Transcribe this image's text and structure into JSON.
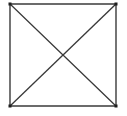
{
  "figure": {
    "background_color": "#ffffff",
    "stroke_color": "#3a3a3a",
    "corner_accent_color": "#1e1e1e",
    "stroke_width": 1.4,
    "canvas": {
      "width": 127,
      "height": 116
    },
    "square": {
      "name": "square-outline",
      "left": 10,
      "top": 4,
      "right": 116,
      "bottom": 106,
      "width": 106,
      "height": 102
    },
    "vertices": {
      "top_left": {
        "label": "top-left",
        "x": 10,
        "y": 4
      },
      "top_right": {
        "label": "top-right",
        "x": 116,
        "y": 4
      },
      "bottom_right": {
        "label": "bottom-right",
        "x": 116,
        "y": 106
      },
      "bottom_left": {
        "label": "bottom-left",
        "x": 10,
        "y": 106
      }
    },
    "center": {
      "label": "center",
      "x": 63,
      "y": 55
    },
    "edges": [
      {
        "name": "top-edge",
        "x1": 10,
        "y1": 4,
        "x2": 116,
        "y2": 4
      },
      {
        "name": "right-edge",
        "x1": 116,
        "y1": 4,
        "x2": 116,
        "y2": 106
      },
      {
        "name": "bottom-edge",
        "x1": 116,
        "y1": 106,
        "x2": 10,
        "y2": 106
      },
      {
        "name": "left-edge",
        "x1": 10,
        "y1": 106,
        "x2": 10,
        "y2": 4
      }
    ],
    "diagonals": [
      {
        "name": "diagonal-tl-br",
        "x1": 10,
        "y1": 4,
        "x2": 116,
        "y2": 106
      },
      {
        "name": "diagonal-tr-bl",
        "x1": 116,
        "y1": 4,
        "x2": 10,
        "y2": 106
      }
    ]
  }
}
